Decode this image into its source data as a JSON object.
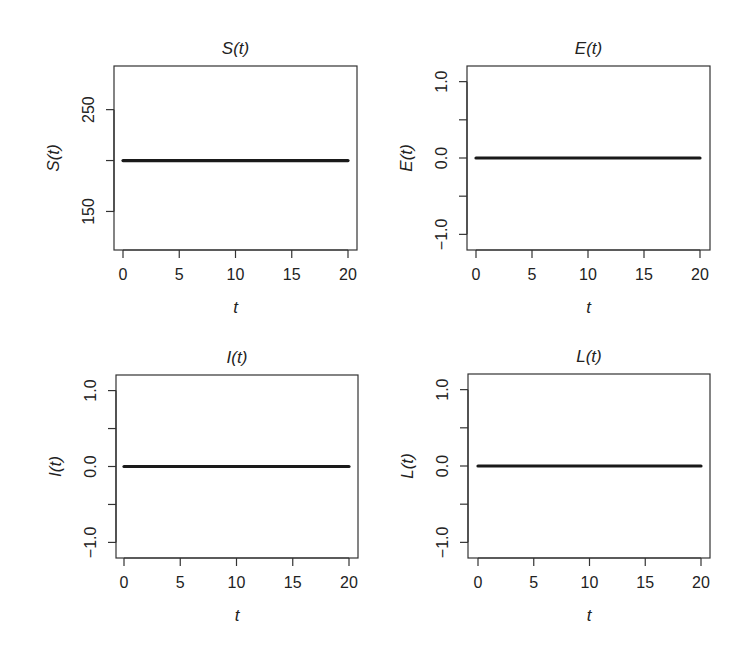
{
  "figure": {
    "width": 747,
    "height": 658,
    "layout": "2x2 grid"
  },
  "chart_data": [
    {
      "type": "line",
      "title": "S(t)",
      "xlabel": "t",
      "ylabel": "S(t)",
      "x": [
        0,
        20
      ],
      "series": [
        {
          "name": "S(t)",
          "values": [
            200,
            200
          ]
        }
      ],
      "xlim": [
        0,
        20
      ],
      "ylim": [
        120,
        285
      ],
      "xticks": [
        0,
        5,
        10,
        15,
        20
      ],
      "xtick_labels": [
        "0",
        "5",
        "10",
        "15",
        "20"
      ],
      "yticks": [
        150,
        200,
        250
      ],
      "ytick_labels": [
        "150",
        "",
        "250"
      ],
      "grid": false,
      "line_color": "#1a1a1a"
    },
    {
      "type": "line",
      "title": "E(t)",
      "xlabel": "t",
      "ylabel": "E(t)",
      "x": [
        0,
        20
      ],
      "series": [
        {
          "name": "E(t)",
          "values": [
            0,
            0
          ]
        }
      ],
      "xlim": [
        0,
        20
      ],
      "ylim": [
        -1.1,
        1.1
      ],
      "xticks": [
        0,
        5,
        10,
        15,
        20
      ],
      "xtick_labels": [
        "0",
        "5",
        "10",
        "15",
        "20"
      ],
      "yticks": [
        -1.0,
        -0.5,
        0.0,
        0.5,
        1.0
      ],
      "ytick_labels": [
        "−1.0",
        "",
        "0.0",
        "",
        "1.0"
      ],
      "grid": false,
      "line_color": "#1a1a1a"
    },
    {
      "type": "line",
      "title": "I(t)",
      "xlabel": "t",
      "ylabel": "I(t)",
      "x": [
        0,
        20
      ],
      "series": [
        {
          "name": "I(t)",
          "values": [
            0,
            0
          ]
        }
      ],
      "xlim": [
        0,
        20
      ],
      "ylim": [
        -1.1,
        1.1
      ],
      "xticks": [
        0,
        5,
        10,
        15,
        20
      ],
      "xtick_labels": [
        "0",
        "5",
        "10",
        "15",
        "20"
      ],
      "yticks": [
        -1.0,
        -0.5,
        0.0,
        0.5,
        1.0
      ],
      "ytick_labels": [
        "−1.0",
        "",
        "0.0",
        "",
        "1.0"
      ],
      "grid": false,
      "line_color": "#1a1a1a"
    },
    {
      "type": "line",
      "title": "L(t)",
      "xlabel": "t",
      "ylabel": "L(t)",
      "x": [
        0,
        20
      ],
      "series": [
        {
          "name": "L(t)",
          "values": [
            0,
            0
          ]
        }
      ],
      "xlim": [
        0,
        20
      ],
      "ylim": [
        -1.1,
        1.1
      ],
      "xticks": [
        0,
        5,
        10,
        15,
        20
      ],
      "xtick_labels": [
        "0",
        "5",
        "10",
        "15",
        "20"
      ],
      "yticks": [
        -1.0,
        -0.5,
        0.0,
        0.5,
        1.0
      ],
      "ytick_labels": [
        "−1.0",
        "",
        "0.0",
        "",
        "1.0"
      ],
      "grid": false,
      "line_color": "#1a1a1a"
    }
  ],
  "panels_geometry": [
    {
      "box": [
        114,
        66,
        357,
        250
      ],
      "px0": 123,
      "px20": 348
    },
    {
      "box": [
        467,
        66,
        710,
        250
      ],
      "px0": 476,
      "px20": 700
    },
    {
      "box": [
        116,
        375,
        358,
        558
      ],
      "px0": 124,
      "px20": 349
    },
    {
      "box": [
        468,
        374,
        710,
        558
      ],
      "px0": 478,
      "px20": 701
    }
  ]
}
